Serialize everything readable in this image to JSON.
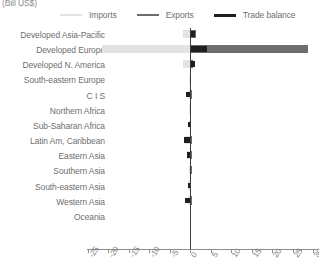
{
  "units_label": "(Bill US$)",
  "legend": {
    "items": [
      {
        "label": "Imports",
        "color": "#e3e3e3",
        "name": "legend-imports"
      },
      {
        "label": "Exports",
        "color": "#6d6d6d",
        "name": "legend-exports"
      },
      {
        "label": "Trade balance",
        "color": "#1f1f1f",
        "name": "legend-trade-balance"
      }
    ]
  },
  "chart_data": {
    "type": "bar",
    "orientation": "horizontal",
    "title": "",
    "subtitle": "",
    "xlabel": "(Bill US$)",
    "ylabel": "",
    "xlim": [
      -25,
      30
    ],
    "xticks": [
      -25,
      -20,
      -15,
      -10,
      -5,
      0,
      5,
      10,
      15,
      20,
      25,
      30
    ],
    "xtick_labels": [
      "-25",
      "-20",
      "-15",
      "-10",
      "-5",
      "0",
      "5",
      "10",
      "15",
      "20",
      "25",
      "30"
    ],
    "grid": false,
    "legend_position": "top",
    "zero_line": true,
    "categories": [
      "Developed Asia-Pacific",
      "Developed Europe",
      "Developed N. America",
      "South-eastern Europe",
      "C I S",
      "Northern Africa",
      "Sub-Saharan Africa",
      "Latin Am, Caribbean",
      "Eastern Asia",
      "Southern Asia",
      "South-eastern Asia",
      "Western Asia",
      "Oceania"
    ],
    "series": [
      {
        "name": "Imports",
        "color": "#e3e3e3",
        "values": [
          -1.6,
          -21.4,
          -1.7,
          -0.2,
          -0.6,
          -0.3,
          -0.2,
          -1.1,
          -0.7,
          -0.3,
          -0.5,
          -0.5,
          -0.1
        ]
      },
      {
        "name": "Exports",
        "color": "#6d6d6d",
        "values": [
          1.4,
          28.8,
          0.7,
          0.3,
          0.6,
          0.2,
          0.2,
          0.6,
          0.5,
          0.4,
          0.3,
          0.5,
          0.1
        ]
      },
      {
        "name": "Trade balance",
        "color": "#1f1f1f",
        "values": [
          1.3,
          4.1,
          1.2,
          0.2,
          -1.0,
          0.2,
          -0.4,
          -1.4,
          -0.8,
          0.3,
          -0.6,
          -1.3,
          0.1
        ]
      }
    ]
  }
}
